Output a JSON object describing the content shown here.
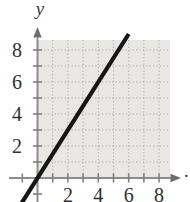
{
  "figure": {
    "trailing_period": ".",
    "colors": {
      "background": "#ffffff",
      "grid_bg": "#e8e7e4",
      "grid_dot": "#adaca9",
      "axis": "#8d8d8b",
      "arrow": "#6e6e6c",
      "tick": "#80807e",
      "label": "#2f2f2f",
      "axis_title": "#3d3d3d",
      "line": "#161616"
    }
  },
  "chart_data": {
    "type": "line",
    "title": "",
    "xlabel": "",
    "ylabel": "y",
    "xlim": [
      -2,
      10
    ],
    "ylim": [
      -1.6,
      9.6
    ],
    "grid": true,
    "legend": false,
    "x_ticks": [
      -1,
      1,
      2,
      3,
      4,
      5,
      6,
      7,
      8
    ],
    "y_ticks": [
      -1,
      1,
      2,
      3,
      4,
      5,
      6,
      7,
      8
    ],
    "x_tick_labels": [
      2,
      4,
      6,
      8
    ],
    "y_tick_labels": [
      8,
      6,
      4,
      2
    ],
    "series": [
      {
        "name": "graphed-line",
        "equation": "y = 1.5x",
        "slope": 1.5,
        "y_intercept": 0,
        "x_start": -1.1,
        "x_end": 6.0,
        "points": [
          [
            -1,
            -1.5
          ],
          [
            0,
            0
          ],
          [
            2,
            3
          ],
          [
            4,
            6
          ],
          [
            6,
            9
          ]
        ]
      }
    ]
  }
}
